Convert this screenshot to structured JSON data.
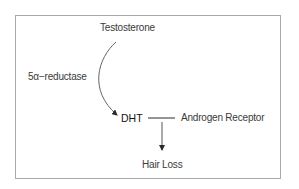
{
  "diagram": {
    "type": "pathway",
    "nodes": {
      "testosterone": "Testosterone",
      "enzyme": "5α−reductase",
      "dht": "DHT",
      "receptor": "Androgen Receptor",
      "outcome": "Hair Loss"
    },
    "edges": [
      {
        "from": "Testosterone",
        "to": "DHT",
        "label": "5α−reductase",
        "style": "curved-arrow"
      },
      {
        "from": "DHT",
        "to": "Androgen Receptor",
        "style": "line"
      },
      {
        "from": "DHT—Androgen Receptor",
        "to": "Hair Loss",
        "style": "arrow"
      }
    ],
    "colors": {
      "border": "#a9a9a9",
      "text": "#3a3a3a",
      "emphasis_text": "#111111",
      "arrow": "#555555",
      "background": "#ffffff"
    }
  }
}
